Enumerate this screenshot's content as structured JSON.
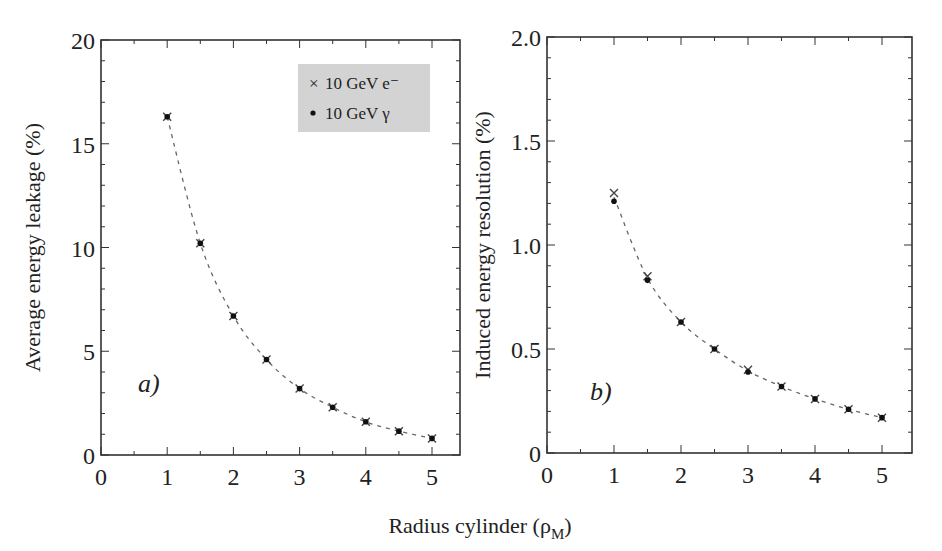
{
  "figure": {
    "shared_xlabel": "Radius cylinder (ρ",
    "shared_xlabel_sub": "M",
    "shared_xlabel_close": ")"
  },
  "legend": {
    "items": [
      {
        "marker": "x-marker",
        "label": "10 GeV e⁻"
      },
      {
        "marker": "dot-marker",
        "label": "10 GeV γ"
      }
    ],
    "background": "#d3d3d3"
  },
  "chart_data": [
    {
      "type": "scatter",
      "panel": "a)",
      "title": "",
      "xlabel": "Radius cylinder (ρM)",
      "ylabel": "Average energy leakage (%)",
      "xlim": [
        0,
        5.45
      ],
      "ylim": [
        0,
        20
      ],
      "xticks": [
        "0",
        "1",
        "2",
        "3",
        "4",
        "5"
      ],
      "yticks": [
        "0",
        "5",
        "10",
        "15",
        "20"
      ],
      "grid": false,
      "legend_position": "upper right",
      "fit_line": "dashed",
      "x": [
        1,
        1.5,
        2,
        2.5,
        3,
        3.5,
        4,
        4.5,
        5
      ],
      "series": [
        {
          "name": "10 GeV e⁻",
          "marker": "x",
          "values": [
            16.3,
            10.2,
            6.7,
            4.6,
            3.2,
            2.3,
            1.6,
            1.15,
            0.8
          ]
        },
        {
          "name": "10 GeV γ",
          "marker": "dot",
          "values": [
            16.3,
            10.2,
            6.7,
            4.6,
            3.2,
            2.3,
            1.6,
            1.15,
            0.8
          ]
        }
      ]
    },
    {
      "type": "scatter",
      "panel": "b)",
      "title": "",
      "xlabel": "Radius cylinder (ρM)",
      "ylabel": "Induced energy resolution (%)",
      "xlim": [
        0,
        5.45
      ],
      "ylim": [
        0,
        2.0
      ],
      "xticks": [
        "0",
        "1",
        "2",
        "3",
        "4",
        "5"
      ],
      "yticks": [
        "0",
        "0.5",
        "1.0",
        "1.5",
        "2.0"
      ],
      "grid": false,
      "fit_line": "dashed",
      "x": [
        1,
        1.5,
        2,
        2.5,
        3,
        3.5,
        4,
        4.5,
        5
      ],
      "series": [
        {
          "name": "10 GeV e⁻",
          "marker": "x",
          "values": [
            1.25,
            0.85,
            0.63,
            0.5,
            0.4,
            0.32,
            0.26,
            0.21,
            0.17
          ]
        },
        {
          "name": "10 GeV γ",
          "marker": "dot",
          "values": [
            1.21,
            0.83,
            0.63,
            0.5,
            0.39,
            0.32,
            0.26,
            0.21,
            0.17
          ]
        }
      ]
    }
  ]
}
